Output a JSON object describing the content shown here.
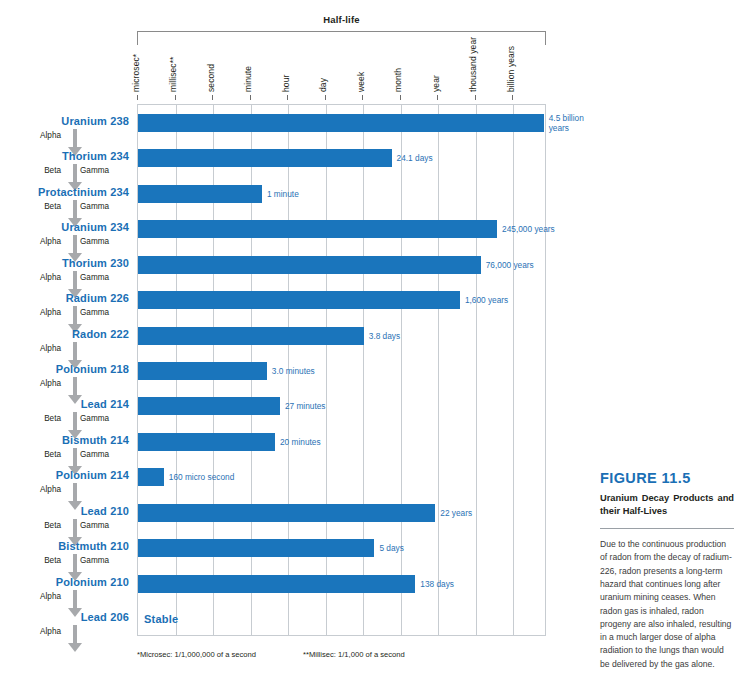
{
  "figure": {
    "bracket_title": "Half-life",
    "number": "FIGURE 11.5",
    "title": "Uranium Decay Products and their Half-Lives",
    "body": "Due to the continuous production of radon from the decay of radium-226, radon presents a long-term hazard that continues long after uranium mining ceases. When radon gas is inhaled, radon progeny are also inhaled, resulting in a much larger dose of alpha radiation to the lungs than would be delivered by the gas alone.",
    "stable_label": "Stable"
  },
  "footnotes": [
    "*Microsec: 1/1,000,000 of a second",
    "**Millisec: 1/1,000 of a second"
  ],
  "colors": {
    "bar": "#1a75bc",
    "label_blue": "#1a6fb5",
    "value_blue": "#2a72b5",
    "arrow_gray": "#a7a9ac",
    "grid": "#c7ccd1"
  },
  "chart_data": {
    "type": "bar",
    "title": "Half-life",
    "xlabel": "",
    "ylabel": "",
    "orientation": "horizontal",
    "scale": "logarithmic",
    "grid": true,
    "legend": false,
    "axis_ticks": [
      "microsec*",
      "millisec**",
      "second",
      "minute",
      "hour",
      "day",
      "week",
      "month",
      "year",
      "thousand year",
      "billion years"
    ],
    "categories": [
      "Uranium 238",
      "Thorium 234",
      "Protactinium 234",
      "Uranium 234",
      "Thorium 230",
      "Radium 226",
      "Radon 222",
      "Polonium 218",
      "Lead 214",
      "Bismuth 214",
      "Polonium 214",
      "Lead 210",
      "Bistmuth 210",
      "Polonium 210",
      "Lead 206"
    ],
    "value_labels": [
      "4.5 billion years",
      "24.1 days",
      "1 minute",
      "245,000 years",
      "76,000 years",
      "1,600 years",
      "3.8 days",
      "3.0 minutes",
      "27 minutes",
      "20 minutes",
      "160 micro second",
      "22 years",
      "5 days",
      "138 days",
      "Stable"
    ],
    "bar_fractions": [
      0.992,
      0.62,
      0.303,
      0.878,
      0.838,
      0.787,
      0.552,
      0.315,
      0.347,
      0.335,
      0.063,
      0.727,
      0.578,
      0.678,
      0.0
    ],
    "emissions": [
      {
        "left": "Alpha",
        "right": ""
      },
      {
        "left": "Beta",
        "right": "Gamma"
      },
      {
        "left": "Beta",
        "right": "Gamma"
      },
      {
        "left": "Alpha",
        "right": "Gamma"
      },
      {
        "left": "Alpha",
        "right": "Gamma"
      },
      {
        "left": "Alpha",
        "right": "Gamma"
      },
      {
        "left": "Alpha",
        "right": ""
      },
      {
        "left": "Alpha",
        "right": ""
      },
      {
        "left": "Beta",
        "right": "Gamma"
      },
      {
        "left": "Beta",
        "right": "Gamma"
      },
      {
        "left": "Alpha",
        "right": ""
      },
      {
        "left": "Beta",
        "right": "Gamma"
      },
      {
        "left": "Beta",
        "right": "Gamma"
      },
      {
        "left": "Alpha",
        "right": ""
      },
      {
        "left": "Alpha",
        "right": ""
      }
    ]
  }
}
